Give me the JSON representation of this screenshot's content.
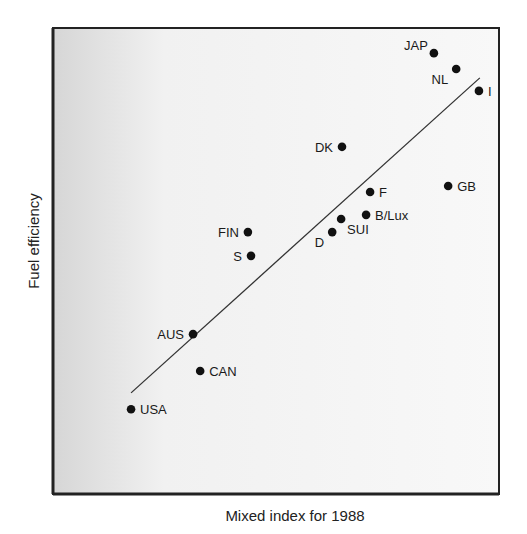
{
  "chart_data": {
    "type": "scatter",
    "title": "",
    "xlabel": "Mixed index for 1988",
    "ylabel": "Fuel efficiency",
    "xlim": [
      0,
      100
    ],
    "ylim": [
      0,
      100
    ],
    "grid": false,
    "legend": null,
    "ticks": {
      "x": [],
      "y": []
    },
    "points": [
      {
        "label": "USA",
        "x": 17.5,
        "y": 18.2,
        "label_pos": "right"
      },
      {
        "label": "CAN",
        "x": 33.0,
        "y": 26.4,
        "label_pos": "right"
      },
      {
        "label": "AUS",
        "x": 31.4,
        "y": 34.3,
        "label_pos": "left"
      },
      {
        "label": "S",
        "x": 44.4,
        "y": 51.1,
        "label_pos": "left"
      },
      {
        "label": "FIN",
        "x": 43.7,
        "y": 56.2,
        "label_pos": "left"
      },
      {
        "label": "D",
        "x": 62.6,
        "y": 56.2,
        "label_pos": "below-left"
      },
      {
        "label": "SUI",
        "x": 64.6,
        "y": 59.0,
        "label_pos": "below-right"
      },
      {
        "label": "B/Lux",
        "x": 70.2,
        "y": 59.9,
        "label_pos": "right"
      },
      {
        "label": "F",
        "x": 71.1,
        "y": 64.8,
        "label_pos": "right"
      },
      {
        "label": "DK",
        "x": 64.8,
        "y": 74.5,
        "label_pos": "left"
      },
      {
        "label": "GB",
        "x": 88.6,
        "y": 66.1,
        "label_pos": "right"
      },
      {
        "label": "I",
        "x": 95.5,
        "y": 86.5,
        "label_pos": "right"
      },
      {
        "label": "NL",
        "x": 90.4,
        "y": 91.2,
        "label_pos": "below-left"
      },
      {
        "label": "JAP",
        "x": 85.4,
        "y": 94.6,
        "label_pos": "above-left"
      }
    ],
    "trend_line": {
      "x": [
        17.5,
        95.7
      ],
      "y": [
        21.7,
        89.3
      ]
    }
  },
  "colors": {
    "plot_background_left": "#d8d8d8",
    "plot_background_right": "#f7f7f7",
    "border": "#222222",
    "marker": "#111111",
    "line": "#333333"
  }
}
